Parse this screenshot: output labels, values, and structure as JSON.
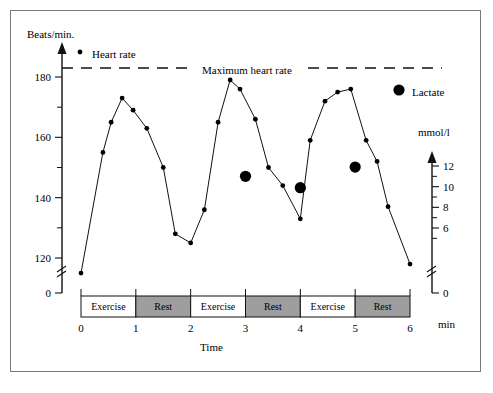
{
  "chart_data": {
    "type": "line",
    "title": "",
    "xlabel": "Time",
    "xunit": "min",
    "ylabel_left": "Beats/min.",
    "ylabel_right": "mmol/l",
    "x_ticks": [
      0,
      1,
      2,
      3,
      4,
      5,
      6
    ],
    "x_tick_labels": [
      "0",
      "1",
      "2",
      "3",
      "4",
      "5",
      "6"
    ],
    "xlim": [
      0,
      6
    ],
    "y_left_major_ticks": [
      120,
      140,
      160,
      180
    ],
    "y_left_major_labels": [
      "120",
      "140",
      "160",
      "180"
    ],
    "y_left_minor_ticks": [
      130,
      150,
      170
    ],
    "y_left_zero_label": "0",
    "y_left_axis_break": true,
    "ylim_left": [
      115,
      188
    ],
    "y_right_major_ticks": [
      6,
      8,
      10,
      12
    ],
    "y_right_major_labels": [
      "6",
      "8",
      "10",
      "12"
    ],
    "y_right_minor_ticks": [
      5,
      7,
      9,
      11
    ],
    "y_right_zero_label": "0",
    "y_right_axis_break": true,
    "ylim_right": [
      5,
      13
    ],
    "grid": false,
    "legend_position": "top",
    "annotations": [
      {
        "name": "maximum-heart-rate-line",
        "label": "Maximum heart rate",
        "value": 183,
        "style": "dashed"
      }
    ],
    "series": [
      {
        "name": "Heart rate",
        "marker": "small-filled-circle",
        "axis": "left",
        "unit": "beats/min",
        "points": [
          {
            "x": 0.0,
            "y": 115
          },
          {
            "x": 0.4,
            "y": 155
          },
          {
            "x": 0.55,
            "y": 165
          },
          {
            "x": 0.75,
            "y": 173
          },
          {
            "x": 0.95,
            "y": 169
          },
          {
            "x": 1.2,
            "y": 163
          },
          {
            "x": 1.5,
            "y": 150
          },
          {
            "x": 1.72,
            "y": 128
          },
          {
            "x": 2.0,
            "y": 125
          },
          {
            "x": 2.25,
            "y": 136
          },
          {
            "x": 2.5,
            "y": 165
          },
          {
            "x": 2.72,
            "y": 179
          },
          {
            "x": 2.9,
            "y": 176
          },
          {
            "x": 3.18,
            "y": 166
          },
          {
            "x": 3.42,
            "y": 150
          },
          {
            "x": 3.68,
            "y": 144
          },
          {
            "x": 4.0,
            "y": 133
          },
          {
            "x": 4.18,
            "y": 159
          },
          {
            "x": 4.45,
            "y": 172
          },
          {
            "x": 4.68,
            "y": 175
          },
          {
            "x": 4.92,
            "y": 176
          },
          {
            "x": 5.2,
            "y": 159
          },
          {
            "x": 5.4,
            "y": 152
          },
          {
            "x": 5.6,
            "y": 137
          },
          {
            "x": 6.0,
            "y": 118
          }
        ]
      },
      {
        "name": "Lactate",
        "marker": "large-filled-circle",
        "axis": "right",
        "unit": "mmol/l",
        "points": [
          {
            "x": 3.0,
            "y": 11.0
          },
          {
            "x": 4.0,
            "y": 9.9
          },
          {
            "x": 5.0,
            "y": 11.9
          }
        ]
      }
    ],
    "activity_bands": [
      {
        "label": "Exercise",
        "start": 0,
        "end": 1,
        "fill": "#ffffff"
      },
      {
        "label": "Rest",
        "start": 1,
        "end": 2,
        "fill": "#9e9e9e"
      },
      {
        "label": "Exercise",
        "start": 2,
        "end": 3,
        "fill": "#ffffff"
      },
      {
        "label": "Rest",
        "start": 3,
        "end": 4,
        "fill": "#9e9e9e"
      },
      {
        "label": "Exercise",
        "start": 4,
        "end": 5,
        "fill": "#ffffff"
      },
      {
        "label": "Rest",
        "start": 5,
        "end": 6,
        "fill": "#9e9e9e"
      }
    ],
    "legend": [
      {
        "name": "Heart rate",
        "marker": "small-filled-circle"
      },
      {
        "name": "Lactate",
        "marker": "large-filled-circle"
      }
    ],
    "colors": {
      "line": "#111111",
      "marker": "#000000",
      "rest_band": "#9e9e9e",
      "exercise_band": "#ffffff",
      "frame": "#7a7a7a",
      "axis": "#111111"
    }
  },
  "labels": {
    "y_left_title": "Beats/min.",
    "y_right_title": "mmol/l",
    "x_title": "Time",
    "x_unit": "min",
    "legend_heart_rate": "Heart rate",
    "legend_lactate": "Lactate",
    "max_hr_label": "Maximum heart rate"
  }
}
